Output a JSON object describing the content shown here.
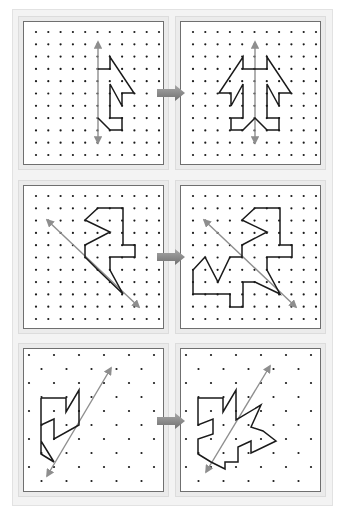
{
  "figure": {
    "colors": {
      "background": "#ffffff",
      "sheet": "#f3f3f3",
      "frame": "#ebebeb",
      "panel_border": "#6f6f6f",
      "dot": "#1a1a1a",
      "shape": "#1a1a1a",
      "axis": "#8e8e8e",
      "arrow": "#8a8a8a"
    },
    "rows": [
      {
        "name": "vertical-axis",
        "grid": "square",
        "arrow": {
          "x": 157,
          "y": 85,
          "w": 28,
          "h": 16
        },
        "panels": [
          {
            "role": "original",
            "box": {
              "x": 23,
              "y": 21,
              "w": 141,
              "h": 144
            },
            "grid": {
              "x0": 36,
              "y0": 32,
              "dx": 12.3,
              "dy": 12.3,
              "cols": 11,
              "rows": 11,
              "stagger": false
            },
            "axis": [
              [
                98,
                42
              ],
              [
                98,
                143
              ]
            ],
            "shape": [
              [
                98,
                69
              ],
              [
                110,
                69
              ],
              [
                110,
                57
              ],
              [
                134,
                93
              ],
              [
                122,
                93
              ],
              [
                122,
                106
              ],
              [
                110,
                84
              ],
              [
                110,
                118
              ],
              [
                122,
                118
              ],
              [
                122,
                130
              ],
              [
                110,
                130
              ],
              [
                98,
                118
              ]
            ],
            "closed": false
          },
          {
            "role": "reflected",
            "box": {
              "x": 180,
              "y": 21,
              "w": 141,
              "h": 144
            },
            "grid": {
              "x0": 193,
              "y0": 32,
              "dx": 12.3,
              "dy": 12.3,
              "cols": 11,
              "rows": 11,
              "stagger": false
            },
            "axis": [
              [
                255,
                42
              ],
              [
                255,
                143
              ]
            ],
            "shape": [
              [
                243,
                69
              ],
              [
                243,
                57
              ],
              [
                219,
                93
              ],
              [
                231,
                93
              ],
              [
                231,
                106
              ],
              [
                243,
                84
              ],
              [
                243,
                118
              ],
              [
                231,
                118
              ],
              [
                231,
                130
              ],
              [
                243,
                130
              ],
              [
                255,
                118
              ],
              [
                267,
                130
              ],
              [
                279,
                130
              ],
              [
                279,
                118
              ],
              [
                267,
                118
              ],
              [
                267,
                84
              ],
              [
                279,
                106
              ],
              [
                279,
                93
              ],
              [
                291,
                93
              ],
              [
                267,
                57
              ],
              [
                267,
                69
              ],
              [
                243,
                69
              ]
            ],
            "closed": true
          }
        ]
      },
      {
        "name": "diagonal-axis-down",
        "grid": "square",
        "arrow": {
          "x": 157,
          "y": 249,
          "w": 28,
          "h": 16
        },
        "panels": [
          {
            "role": "original",
            "box": {
              "x": 23,
              "y": 185,
              "w": 141,
              "h": 144
            },
            "grid": {
              "x0": 36,
              "y0": 196,
              "dx": 12.3,
              "dy": 12.3,
              "cols": 11,
              "rows": 11,
              "stagger": false
            },
            "axis": [
              [
                47,
                220
              ],
              [
                139,
                307
              ]
            ],
            "shape": [
              [
                98,
                208
              ],
              [
                123,
                208
              ],
              [
                123,
                245
              ],
              [
                135,
                245
              ],
              [
                135,
                257
              ],
              [
                110,
                257
              ],
              [
                110,
                270
              ],
              [
                123,
                294
              ],
              [
                98,
                270
              ],
              [
                85,
                257
              ],
              [
                85,
                245
              ],
              [
                110,
                232
              ],
              [
                85,
                220
              ],
              [
                98,
                208
              ]
            ],
            "closed": true
          },
          {
            "role": "reflected",
            "box": {
              "x": 180,
              "y": 185,
              "w": 141,
              "h": 144
            },
            "grid": {
              "x0": 193,
              "y0": 196,
              "dx": 12.3,
              "dy": 12.3,
              "cols": 11,
              "rows": 11,
              "stagger": false
            },
            "axis": [
              [
                204,
                220
              ],
              [
                296,
                307
              ]
            ],
            "shape": [
              [
                255,
                208
              ],
              [
                280,
                208
              ],
              [
                280,
                245
              ],
              [
                292,
                245
              ],
              [
                292,
                257
              ],
              [
                267,
                257
              ],
              [
                267,
                270
              ],
              [
                280,
                294
              ],
              [
                255,
                282
              ],
              [
                243,
                282
              ],
              [
                243,
                307
              ],
              [
                230,
                307
              ],
              [
                230,
                294
              ],
              [
                193,
                294
              ],
              [
                193,
                270
              ],
              [
                205,
                257
              ],
              [
                218,
                282
              ],
              [
                230,
                257
              ],
              [
                242,
                257
              ],
              [
                242,
                245
              ],
              [
                267,
                232
              ],
              [
                242,
                220
              ],
              [
                255,
                208
              ]
            ],
            "closed": true
          }
        ]
      },
      {
        "name": "diagonal-axis-up",
        "grid": "staggered",
        "arrow": {
          "x": 157,
          "y": 413,
          "w": 28,
          "h": 16
        },
        "panels": [
          {
            "role": "original",
            "box": {
              "x": 23,
              "y": 348,
              "w": 141,
              "h": 144
            },
            "grid": {
              "x0": 29,
              "y0": 355,
              "dx": 25,
              "dy": 14,
              "cols": 6,
              "rows": 10,
              "stagger": true
            },
            "axis": [
              [
                47,
                476
              ],
              [
                111,
                368
              ]
            ],
            "shape": [
              [
                41,
                398
              ],
              [
                66,
                398
              ],
              [
                66,
                412
              ],
              [
                79,
                390
              ],
              [
                79,
                425
              ],
              [
                54,
                439
              ],
              [
                54,
                419
              ],
              [
                41,
                425
              ],
              [
                41,
                454
              ],
              [
                54,
                462
              ],
              [
                41,
                441
              ],
              [
                41,
                398
              ]
            ],
            "closed": false
          },
          {
            "role": "reflected",
            "box": {
              "x": 180,
              "y": 348,
              "w": 141,
              "h": 144
            },
            "grid": {
              "x0": 186,
              "y0": 355,
              "dx": 25,
              "dy": 14,
              "cols": 6,
              "rows": 10,
              "stagger": true
            },
            "axis": [
              [
                206,
                472
              ],
              [
                270,
                366
              ]
            ],
            "shape": [
              [
                198,
                398
              ],
              [
                223,
                398
              ],
              [
                223,
                412
              ],
              [
                236,
                390
              ],
              [
                236,
                420
              ],
              [
                261,
                405
              ],
              [
                251,
                427
              ],
              [
                263,
                431
              ],
              [
                276,
                441
              ],
              [
                251,
                453
              ],
              [
                251,
                441
              ],
              [
                238,
                447
              ],
              [
                238,
                462
              ],
              [
                225,
                462
              ],
              [
                225,
                469
              ],
              [
                211,
                462
              ],
              [
                198,
                454
              ],
              [
                198,
                439
              ],
              [
                213,
                434
              ],
              [
                213,
                419
              ],
              [
                198,
                425
              ],
              [
                198,
                398
              ]
            ],
            "closed": true
          }
        ]
      }
    ]
  }
}
